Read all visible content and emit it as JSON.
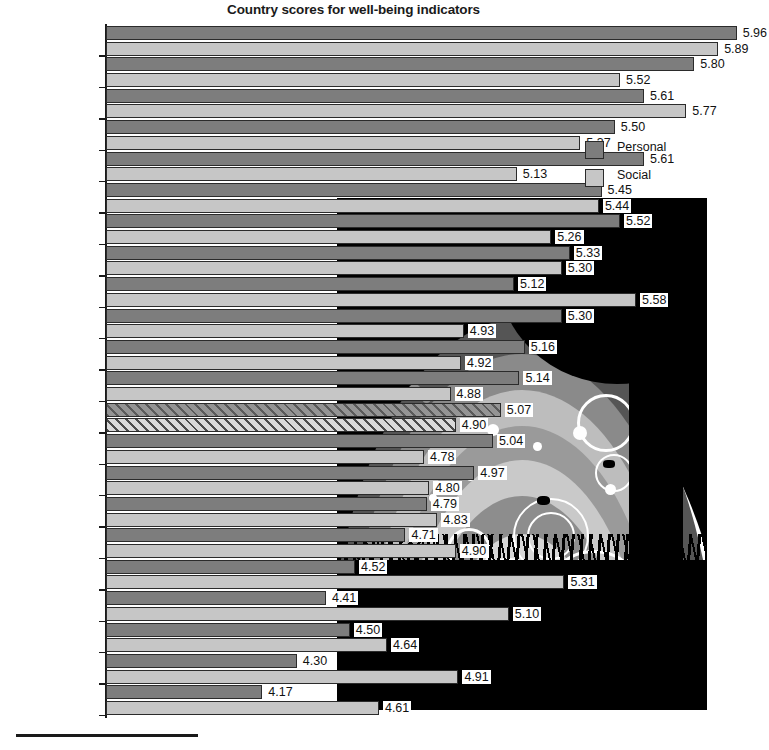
{
  "chart_data": {
    "type": "bar",
    "title": "Country scores for well-being indicators",
    "xlabel": "",
    "ylabel": "",
    "orientation": "horizontal",
    "grid": false,
    "legend_position": "top-right",
    "value_axis_start": 3.58,
    "px_per_unit": 265,
    "categories": [
      "Denmark",
      "Switzerland",
      "Norway",
      "Ireland",
      "Austria",
      "Sweden",
      "Finland",
      "Netherlands",
      "Spain",
      "Cyprus",
      "Belgium",
      "Germany",
      "UK",
      "Slovenia",
      "France",
      "Poland",
      "Estonia",
      "Portugal",
      "Hungary",
      "Slovakia",
      "Bulgaria",
      "Ukraine"
    ],
    "series": [
      {
        "name": "Personal",
        "color": "#7d7d7d",
        "values": [
          5.96,
          5.8,
          5.61,
          5.5,
          5.61,
          5.45,
          5.52,
          5.33,
          5.12,
          5.3,
          5.16,
          5.14,
          5.07,
          5.04,
          4.97,
          4.79,
          4.71,
          4.52,
          4.41,
          4.5,
          4.3,
          4.17
        ]
      },
      {
        "name": "Social",
        "color": "#c6c6c6",
        "values": [
          5.89,
          5.52,
          5.77,
          5.37,
          5.13,
          5.44,
          5.26,
          5.3,
          5.58,
          4.93,
          4.92,
          4.88,
          4.9,
          4.78,
          4.8,
          4.83,
          4.9,
          5.31,
          5.1,
          4.64,
          4.91,
          4.61
        ]
      }
    ],
    "highlighted_category": "UK",
    "highlight_style": "hatched"
  },
  "legend": {
    "items": [
      {
        "label": "Personal",
        "swatch": "personal"
      },
      {
        "label": "Social",
        "swatch": "social"
      }
    ]
  },
  "artwork": {
    "name": "tree-rainbow-decoration",
    "description": "black silhouette artwork with tree, rainbow arcs, swirls, butterflies and grass"
  }
}
